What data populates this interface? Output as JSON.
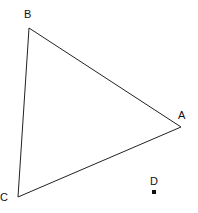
{
  "diagram": {
    "type": "triangle with external point",
    "vertices": {
      "A": {
        "label": "A",
        "x": 181,
        "y": 127
      },
      "B": {
        "label": "B",
        "x": 29,
        "y": 28
      },
      "C": {
        "label": "C",
        "x": 18,
        "y": 197
      }
    },
    "point_D": {
      "label": "D",
      "x": 154,
      "y": 192
    },
    "stroke_color": "#222222"
  }
}
